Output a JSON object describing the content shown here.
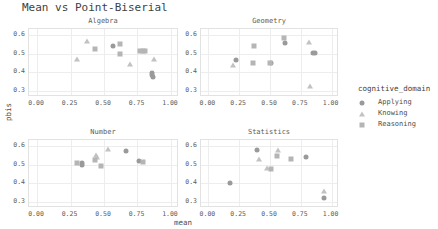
{
  "title": "Mean vs Point-Biserial",
  "axes": {
    "xlabel": "mean",
    "ylabel": "pbis",
    "xticks": [
      "0.00",
      "0.25",
      "0.50",
      "0.75",
      "1.00"
    ],
    "yticks": [
      "0.3",
      "0.4",
      "0.5",
      "0.6"
    ]
  },
  "legend": {
    "title": "cognitive_domain",
    "items": [
      {
        "label": "Applying",
        "marker": "circle",
        "color": "#9a9a9a"
      },
      {
        "label": "Knowing",
        "marker": "triangle",
        "color": "#c2c2c2"
      },
      {
        "label": "Reasoning",
        "marker": "square",
        "color": "#b5b5b5"
      }
    ]
  },
  "chart_data": {
    "type": "scatter",
    "title": "Mean vs Point-Biserial",
    "xlabel": "mean",
    "ylabel": "pbis",
    "xlim": [
      -0.06,
      1.06
    ],
    "ylim": [
      0.27,
      0.63
    ],
    "xticks": [
      0.0,
      0.25,
      0.5,
      0.75,
      1.0
    ],
    "yticks": [
      0.3,
      0.4,
      0.5,
      0.6
    ],
    "grid": true,
    "legend_position": "right",
    "facet_variable": "content_domain",
    "color_variable": "cognitive_domain",
    "facets": [
      {
        "name": "Algebra",
        "series": [
          {
            "name": "Applying",
            "marker": "circle",
            "points": [
              [
                0.565,
                0.54
              ],
              [
                0.855,
                0.395
              ],
              [
                0.862,
                0.388
              ],
              [
                0.868,
                0.378
              ]
            ]
          },
          {
            "name": "Knowing",
            "marker": "triangle",
            "points": [
              [
                0.375,
                0.568
              ],
              [
                0.295,
                0.47
              ],
              [
                0.695,
                0.447
              ],
              [
                0.875,
                0.47
              ]
            ]
          },
          {
            "name": "Reasoning",
            "marker": "square",
            "points": [
              [
                0.435,
                0.523
              ],
              [
                0.62,
                0.548
              ],
              [
                0.622,
                0.497
              ],
              [
                0.772,
                0.512
              ],
              [
                0.792,
                0.512
              ],
              [
                0.805,
                0.512
              ]
            ]
          }
        ]
      },
      {
        "name": "Geometry",
        "series": [
          {
            "name": "Applying",
            "marker": "circle",
            "points": [
              [
                0.228,
                0.465
              ],
              [
                0.505,
                0.45
              ],
              [
                0.625,
                0.555
              ],
              [
                0.845,
                0.505
              ],
              [
                0.868,
                0.505
              ]
            ]
          },
          {
            "name": "Knowing",
            "marker": "triangle",
            "points": [
              [
                0.198,
                0.442
              ],
              [
                0.818,
                0.562
              ],
              [
                0.822,
                0.33
              ]
            ]
          },
          {
            "name": "Reasoning",
            "marker": "square",
            "points": [
              [
                0.368,
                0.54
              ],
              [
                0.362,
                0.448
              ],
              [
                0.5,
                0.452
              ],
              [
                0.61,
                0.58
              ]
            ]
          }
        ]
      },
      {
        "name": "Number",
        "series": [
          {
            "name": "Applying",
            "marker": "circle",
            "points": [
              [
                0.335,
                0.508
              ],
              [
                0.338,
                0.498
              ],
              [
                0.662,
                0.57
              ],
              [
                0.76,
                0.52
              ]
            ]
          },
          {
            "name": "Knowing",
            "marker": "triangle",
            "points": [
              [
                0.443,
                0.552
              ],
              [
                0.448,
                0.54
              ],
              [
                0.528,
                0.582
              ]
            ]
          },
          {
            "name": "Reasoning",
            "marker": "square",
            "points": [
              [
                0.298,
                0.51
              ],
              [
                0.432,
                0.522
              ],
              [
                0.478,
                0.492
              ],
              [
                0.79,
                0.515
              ]
            ]
          }
        ]
      },
      {
        "name": "Statistics",
        "series": [
          {
            "name": "Applying",
            "marker": "circle",
            "points": [
              [
                0.178,
                0.405
              ],
              [
                0.395,
                0.578
              ],
              [
                0.795,
                0.542
              ],
              [
                0.942,
                0.322
              ]
            ]
          },
          {
            "name": "Knowing",
            "marker": "triangle",
            "points": [
              [
                0.412,
                0.532
              ],
              [
                0.472,
                0.48
              ],
              [
                0.562,
                0.578
              ],
              [
                0.938,
                0.358
              ]
            ]
          },
          {
            "name": "Reasoning",
            "marker": "square",
            "points": [
              [
                0.512,
                0.477
              ],
              [
                0.56,
                0.543
              ],
              [
                0.672,
                0.527
              ]
            ]
          }
        ]
      }
    ]
  },
  "facet_layout": [
    {
      "name": "Algebra",
      "left": 28,
      "top": 28,
      "width": 150,
      "height": 68
    },
    {
      "name": "Geometry",
      "left": 200,
      "top": 28,
      "width": 138,
      "height": 68
    },
    {
      "name": "Number",
      "left": 28,
      "top": 139,
      "width": 150,
      "height": 68
    },
    {
      "name": "Statistics",
      "left": 200,
      "top": 139,
      "width": 138,
      "height": 68
    }
  ]
}
